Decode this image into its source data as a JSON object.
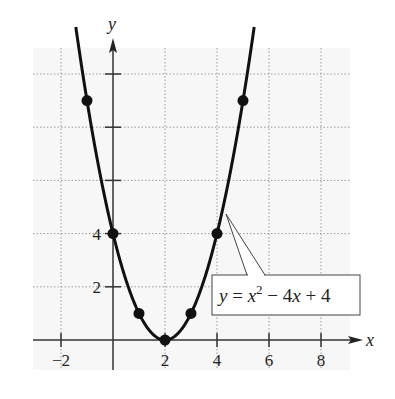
{
  "chart_data": {
    "type": "line",
    "title": "",
    "xlabel": "x",
    "ylabel": "y",
    "xlim": [
      -3,
      9
    ],
    "ylim": [
      -0.5,
      11.5
    ],
    "grid": true,
    "x_ticks": [
      -2,
      2,
      4,
      6,
      8
    ],
    "x_tick_labels": [
      "−2",
      "2",
      "4",
      "6",
      "8"
    ],
    "y_ticks": [
      2,
      4,
      6,
      8,
      10
    ],
    "y_tick_labels": [
      "2",
      "4"
    ],
    "series": [
      {
        "name": "y = x^2 - 4x + 4",
        "function": "x^2 - 4x + 4",
        "points": [
          {
            "x": -1,
            "y": 9
          },
          {
            "x": 0,
            "y": 4
          },
          {
            "x": 1,
            "y": 1
          },
          {
            "x": 2,
            "y": 0
          },
          {
            "x": 3,
            "y": 1
          },
          {
            "x": 4,
            "y": 4
          },
          {
            "x": 5,
            "y": 9
          }
        ]
      }
    ],
    "annotation": {
      "text_parts": [
        "y",
        " = ",
        "x",
        "2",
        " − 4",
        "x",
        " + 4"
      ],
      "points_to": {
        "x": 4.3,
        "y": 5
      }
    }
  }
}
